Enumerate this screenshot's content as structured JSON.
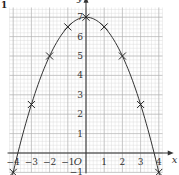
{
  "question_number": "1",
  "chart_data": {
    "type": "scatter",
    "title": "",
    "xlabel": "x",
    "ylabel": "y",
    "origin_label": "O",
    "xlim": [
      -4.2,
      4.2
    ],
    "ylim": [
      -1,
      7.5
    ],
    "grid": true,
    "x_ticks": [
      -4,
      -3,
      -2,
      -1,
      1,
      2,
      3,
      4
    ],
    "y_ticks": [
      -1,
      1,
      2,
      3,
      4,
      5,
      6,
      7
    ],
    "series": [
      {
        "name": "plotted points",
        "marker": "x",
        "x": [
          -4,
          -3,
          -2,
          -1,
          0,
          1,
          2,
          3,
          4
        ],
        "y": [
          -1,
          2.5,
          5,
          6.5,
          7,
          6.5,
          5,
          2.5,
          -1
        ]
      },
      {
        "name": "curve",
        "type": "line",
        "equation": "y = 7 - 0.5x^2",
        "x": [
          -4,
          -3,
          -2,
          -1,
          0,
          1,
          2,
          3,
          4
        ],
        "y": [
          -1,
          2.5,
          5,
          6.5,
          7,
          6.5,
          5,
          2.5,
          -1
        ]
      }
    ],
    "colors": {
      "grid_minor": "#d6d6d6",
      "grid_major": "#b0b0b0",
      "axis": "#333333",
      "curve": "#333333"
    }
  }
}
